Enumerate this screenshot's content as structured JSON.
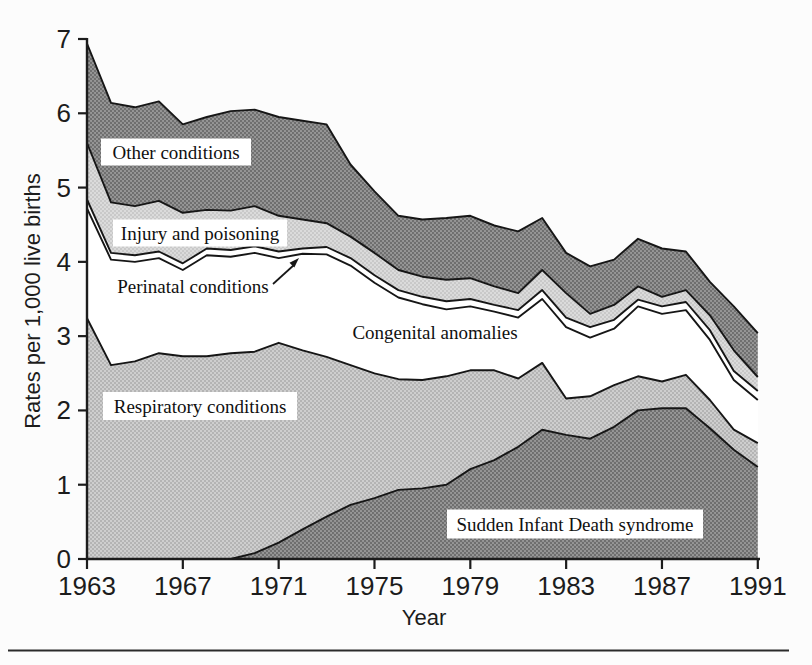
{
  "figure": {
    "background": "#fcfcfc",
    "page_rule_color": "#2b2b2b"
  },
  "chart_data": {
    "type": "area",
    "stacked": true,
    "title": "",
    "xlabel": "Year",
    "ylabel": "Rates per 1,000 live births",
    "xlim": [
      1963,
      1991
    ],
    "ylim": [
      0,
      7
    ],
    "grid": false,
    "legend": "inline-annotations",
    "x_ticks": [
      1963,
      1967,
      1971,
      1975,
      1979,
      1983,
      1987,
      1991
    ],
    "y_ticks": [
      0,
      1,
      2,
      3,
      4,
      5,
      6,
      7
    ],
    "years": [
      1963,
      1964,
      1965,
      1966,
      1967,
      1968,
      1969,
      1970,
      1971,
      1972,
      1973,
      1974,
      1975,
      1976,
      1977,
      1978,
      1979,
      1980,
      1981,
      1982,
      1983,
      1984,
      1985,
      1986,
      1987,
      1988,
      1989,
      1990,
      1991
    ],
    "series": [
      {
        "name": "Sudden Infant Death syndrome",
        "fill": "halftone-dark",
        "values": [
          0.0,
          0.0,
          0.0,
          0.0,
          0.0,
          0.0,
          0.0,
          0.08,
          0.22,
          0.4,
          0.57,
          0.73,
          0.82,
          0.93,
          0.95,
          1.0,
          1.21,
          1.33,
          1.51,
          1.74,
          1.67,
          1.62,
          1.78,
          2.0,
          2.03,
          2.03,
          1.76,
          1.47,
          1.24
        ]
      },
      {
        "name": "Respiratory conditions",
        "fill": "halftone-light",
        "values": [
          3.24,
          2.61,
          2.66,
          2.77,
          2.73,
          2.73,
          2.77,
          2.71,
          2.69,
          2.41,
          2.15,
          1.88,
          1.68,
          1.49,
          1.46,
          1.46,
          1.33,
          1.21,
          0.92,
          0.9,
          0.49,
          0.57,
          0.56,
          0.46,
          0.36,
          0.45,
          0.38,
          0.27,
          0.32
        ]
      },
      {
        "name": "Congenital anomalies",
        "fill": "white",
        "values": [
          1.48,
          1.42,
          1.34,
          1.28,
          1.16,
          1.36,
          1.3,
          1.33,
          1.14,
          1.3,
          1.38,
          1.34,
          1.22,
          1.1,
          1.02,
          0.9,
          0.86,
          0.79,
          0.82,
          0.86,
          0.96,
          0.79,
          0.76,
          0.94,
          0.91,
          0.87,
          0.81,
          0.67,
          0.58
        ]
      },
      {
        "name": "Perinatal conditions",
        "fill": "white",
        "values": [
          0.12,
          0.09,
          0.09,
          0.09,
          0.09,
          0.09,
          0.09,
          0.09,
          0.09,
          0.07,
          0.1,
          0.1,
          0.1,
          0.1,
          0.1,
          0.11,
          0.1,
          0.09,
          0.1,
          0.12,
          0.13,
          0.14,
          0.12,
          0.09,
          0.1,
          0.11,
          0.13,
          0.12,
          0.12
        ]
      },
      {
        "name": "Injury and poisoning",
        "fill": "halftone-lighter",
        "values": [
          0.76,
          0.68,
          0.66,
          0.68,
          0.68,
          0.52,
          0.53,
          0.54,
          0.48,
          0.39,
          0.32,
          0.29,
          0.3,
          0.27,
          0.27,
          0.29,
          0.28,
          0.25,
          0.23,
          0.27,
          0.33,
          0.18,
          0.2,
          0.18,
          0.13,
          0.16,
          0.2,
          0.28,
          0.19
        ]
      },
      {
        "name": "Other conditions",
        "fill": "halftone-dark",
        "values": [
          1.34,
          1.34,
          1.33,
          1.34,
          1.19,
          1.25,
          1.34,
          1.3,
          1.33,
          1.33,
          1.33,
          0.97,
          0.83,
          0.73,
          0.77,
          0.83,
          0.84,
          0.82,
          0.83,
          0.7,
          0.54,
          0.64,
          0.61,
          0.64,
          0.65,
          0.52,
          0.45,
          0.59,
          0.59
        ]
      }
    ],
    "annotations": [
      {
        "id": "other",
        "text": "Other conditions",
        "cx": 176,
        "cy": 152,
        "w": 150,
        "h": 27,
        "boxed": true
      },
      {
        "id": "injury",
        "text": "Injury and poisoning",
        "cx": 200,
        "cy": 233,
        "w": 174,
        "h": 27,
        "boxed": true
      },
      {
        "id": "perinatal",
        "text": "Perinatal conditions",
        "cx": 193,
        "cy": 286,
        "w": 170,
        "h": 26,
        "boxed": false,
        "arrow": {
          "x1": 273,
          "y1": 284,
          "x2": 294.5,
          "y2": 264.5,
          "tip_x": 299,
          "tip_y": 258
        }
      },
      {
        "id": "congenital",
        "text": "Congenital anomalies",
        "cx": 435,
        "cy": 332,
        "w": 162,
        "h": 26,
        "boxed": false
      },
      {
        "id": "respiratory",
        "text": "Respiratory conditions",
        "cx": 200,
        "cy": 406,
        "w": 194,
        "h": 28,
        "boxed": true
      },
      {
        "id": "sids",
        "text": "Sudden Infant Death syndrome",
        "cx": 575,
        "cy": 524,
        "w": 256,
        "h": 29,
        "boxed": true
      }
    ],
    "palette": {
      "dark_base": "#979797",
      "dark_dot": "#6d6d6d",
      "light_base": "#cecece",
      "light_dot": "#ababab",
      "lighter_base": "#dbdbdb",
      "lighter_dot": "#c1c1c1",
      "white": "#ffffff",
      "line": "#161616",
      "axis": "#1c1c1c"
    }
  }
}
